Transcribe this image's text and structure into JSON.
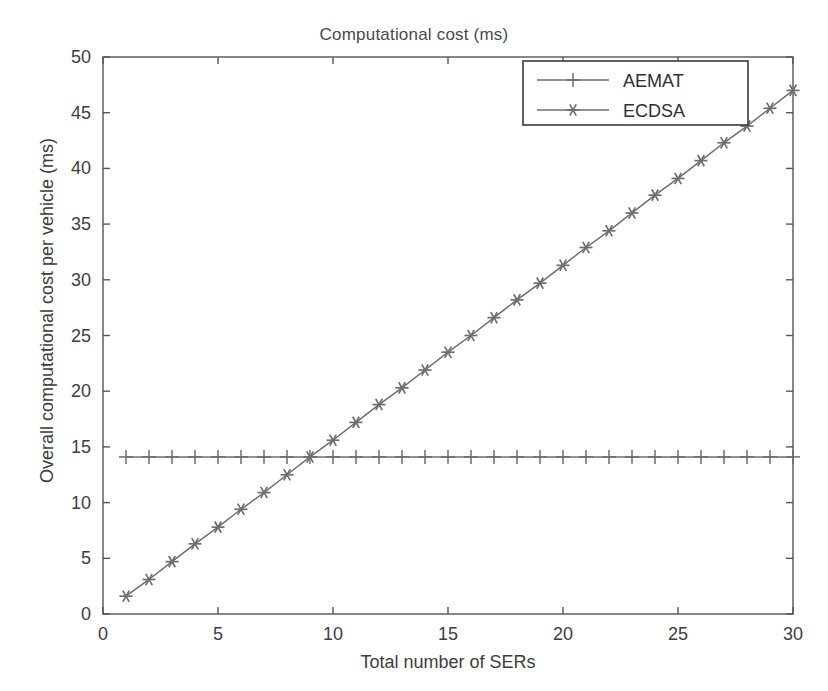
{
  "chart_data": {
    "type": "line",
    "title": "Computational cost (ms)",
    "xlabel": "Total number of SERs",
    "ylabel": "Overall computational cost per vehicle (ms)",
    "xlim": [
      0,
      30
    ],
    "ylim": [
      0,
      50
    ],
    "xticks": [
      0,
      5,
      10,
      15,
      20,
      25,
      30
    ],
    "yticks": [
      0,
      5,
      10,
      15,
      20,
      25,
      30,
      35,
      40,
      45,
      50
    ],
    "grid": false,
    "legend_position": "top-right",
    "x": [
      1,
      2,
      3,
      4,
      5,
      6,
      7,
      8,
      9,
      10,
      11,
      12,
      13,
      14,
      15,
      16,
      17,
      18,
      19,
      20,
      21,
      22,
      23,
      24,
      25,
      26,
      27,
      28,
      29,
      30
    ],
    "series": [
      {
        "name": "AEMAT",
        "marker": "plus",
        "color": "#6e6e6e",
        "values": [
          14.1,
          14.1,
          14.1,
          14.1,
          14.1,
          14.1,
          14.1,
          14.1,
          14.1,
          14.1,
          14.1,
          14.1,
          14.1,
          14.1,
          14.1,
          14.1,
          14.1,
          14.1,
          14.1,
          14.1,
          14.1,
          14.1,
          14.1,
          14.1,
          14.1,
          14.1,
          14.1,
          14.1,
          14.1,
          14.1
        ]
      },
      {
        "name": "ECDSA",
        "marker": "asterisk",
        "color": "#6e6e6e",
        "values": [
          1.6,
          3.1,
          4.7,
          6.3,
          7.8,
          9.4,
          10.9,
          12.5,
          14.1,
          15.6,
          17.2,
          18.8,
          20.3,
          21.9,
          23.5,
          25.0,
          26.6,
          28.2,
          29.7,
          31.3,
          32.9,
          34.4,
          36.0,
          37.6,
          39.1,
          40.7,
          42.3,
          43.8,
          45.4,
          47.0
        ]
      }
    ]
  },
  "legend": {
    "entries": [
      {
        "label": "AEMAT"
      },
      {
        "label": "ECDSA"
      }
    ]
  },
  "axes": {
    "x_tick_labels": [
      "0",
      "5",
      "10",
      "15",
      "20",
      "25",
      "30"
    ],
    "y_tick_labels": [
      "0",
      "5",
      "10",
      "15",
      "20",
      "25",
      "30",
      "35",
      "40",
      "45",
      "50"
    ]
  },
  "style": {
    "axis_color": "#555555",
    "series_color": "#6e6e6e",
    "background": "#ffffff"
  }
}
